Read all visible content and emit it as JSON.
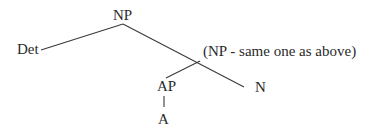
{
  "diagram": {
    "type": "syntax-tree",
    "nodes": {
      "root": "NP",
      "det": "Det",
      "annotation": "(NP - same one as above)",
      "ap": "AP",
      "n": "N",
      "a": "A"
    },
    "edges": [
      {
        "from": "NP",
        "to": "Det"
      },
      {
        "from": "NP",
        "to": "(NP - same one as above)"
      },
      {
        "from": "(NP - same one as above)",
        "to": "AP"
      },
      {
        "from": "(NP - same one as above)",
        "to": "N"
      },
      {
        "from": "AP",
        "to": "A"
      }
    ],
    "colors": {
      "text": "#2a2a2a",
      "line": "#3a3a3a",
      "background": "#ffffff"
    }
  }
}
